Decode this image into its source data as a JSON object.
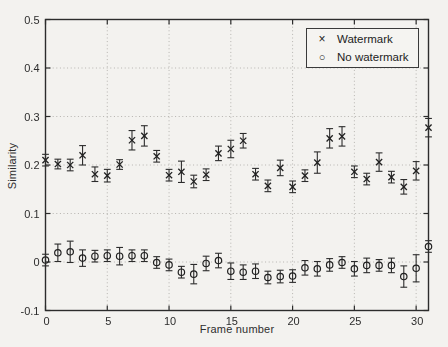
{
  "chart_data": {
    "type": "scatter",
    "subtype": "errorbar",
    "title": "",
    "xlabel": "Frame number",
    "ylabel": "Similarity",
    "xlim": [
      0,
      31
    ],
    "ylim": [
      -0.1,
      0.5
    ],
    "x_ticks": [
      0,
      5,
      10,
      15,
      20,
      25,
      30
    ],
    "x_tick_labels": [
      "0",
      "5",
      "10",
      "15",
      "20",
      "25",
      "30"
    ],
    "y_ticks": [
      -0.1,
      0,
      0.1,
      0.2,
      0.3,
      0.4,
      0.5
    ],
    "y_tick_labels": [
      "-0.1",
      "0",
      "0.1",
      "0.2",
      "0.3",
      "0.4",
      "0.5"
    ],
    "grid": true,
    "grid_style": "dotted",
    "legend_position": "top-right",
    "x": [
      0,
      1,
      2,
      3,
      4,
      5,
      6,
      7,
      8,
      9,
      10,
      11,
      12,
      13,
      14,
      15,
      16,
      17,
      18,
      19,
      20,
      21,
      22,
      23,
      24,
      25,
      26,
      27,
      28,
      29,
      30,
      31
    ],
    "series": [
      {
        "name": "Watermark",
        "marker": "x",
        "marker_glyph": "×",
        "values": [
          0.21,
          0.202,
          0.2,
          0.22,
          0.181,
          0.178,
          0.201,
          0.251,
          0.26,
          0.218,
          0.179,
          0.186,
          0.166,
          0.18,
          0.224,
          0.233,
          0.25,
          0.181,
          0.157,
          0.194,
          0.155,
          0.178,
          0.205,
          0.255,
          0.259,
          0.186,
          0.171,
          0.206,
          0.175,
          0.155,
          0.188,
          0.277
        ],
        "errors": [
          0.012,
          0.01,
          0.012,
          0.02,
          0.015,
          0.013,
          0.01,
          0.02,
          0.021,
          0.012,
          0.012,
          0.022,
          0.013,
          0.012,
          0.015,
          0.018,
          0.015,
          0.012,
          0.012,
          0.016,
          0.012,
          0.012,
          0.022,
          0.02,
          0.02,
          0.012,
          0.012,
          0.019,
          0.012,
          0.015,
          0.019,
          0.019
        ]
      },
      {
        "name": "No watermark",
        "marker": "o",
        "marker_glyph": "○",
        "values": [
          0.004,
          0.019,
          0.021,
          0.008,
          0.012,
          0.013,
          0.012,
          0.013,
          0.013,
          -0.001,
          -0.006,
          -0.021,
          -0.025,
          -0.003,
          0.003,
          -0.019,
          -0.021,
          -0.019,
          -0.032,
          -0.03,
          -0.029,
          -0.012,
          -0.014,
          -0.006,
          -0.001,
          -0.014,
          -0.007,
          -0.007,
          -0.007,
          -0.03,
          -0.013,
          0.032
        ],
        "errors": [
          0.012,
          0.018,
          0.022,
          0.017,
          0.012,
          0.012,
          0.018,
          0.012,
          0.012,
          0.012,
          0.012,
          0.012,
          0.02,
          0.015,
          0.015,
          0.017,
          0.015,
          0.015,
          0.013,
          0.013,
          0.013,
          0.015,
          0.015,
          0.013,
          0.012,
          0.015,
          0.015,
          0.012,
          0.015,
          0.022,
          0.028,
          0.012
        ]
      }
    ],
    "colors": {
      "line": "#2e2e2e",
      "marker": "#232323",
      "grid": "#b4b2ae",
      "text": "#2e2e2e",
      "background": "#f3f2ef"
    }
  }
}
